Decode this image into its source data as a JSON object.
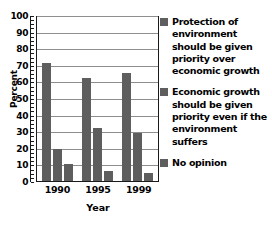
{
  "chart_data": {
    "type": "bar",
    "title": "",
    "xlabel": "Year",
    "ylabel": "Percent",
    "categories": [
      "1990",
      "1995",
      "1999"
    ],
    "ylim": [
      0,
      100
    ],
    "ytick_step": 10,
    "yticks": [
      "100",
      "90",
      "80",
      "70",
      "60",
      "50",
      "40",
      "30",
      "20",
      "10",
      "0"
    ],
    "grid": true,
    "legend_position": "right",
    "bar_color": "#5e5e5e",
    "series": [
      {
        "name": "Protection of environment should be given priority over economic growth",
        "values": [
          71,
          62,
          65
        ]
      },
      {
        "name": "Economic growth should be given priority even if the environment suffers",
        "values": [
          19,
          32,
          29
        ]
      },
      {
        "name": "No opinion",
        "values": [
          10,
          6,
          5
        ]
      }
    ]
  },
  "legend": {
    "entries": [
      "Protection of environment should be given priority over economic growth",
      "Economic growth should be given priority even if the environment suffers",
      "No opinion"
    ]
  }
}
